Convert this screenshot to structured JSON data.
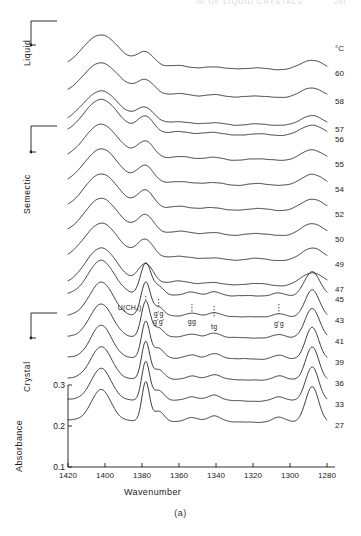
{
  "running_head": {
    "title": "IR OF LIQUID CRYSTALS",
    "page": "241"
  },
  "figure": {
    "caption": "(a)"
  },
  "axes": {
    "x_title": "Wavenumber",
    "y_title": "Absorbance",
    "x_ticks": [
      "1420",
      "1400",
      "1380",
      "1360",
      "1340",
      "1320",
      "1300",
      "1280"
    ],
    "x_tick_values": [
      1420,
      1400,
      1380,
      1360,
      1340,
      1320,
      1300,
      1280
    ],
    "y_ticks": [
      "0.1",
      "0.2",
      "0.3"
    ],
    "y_tick_values": [
      0.1,
      0.2,
      0.3
    ]
  },
  "phases": [
    {
      "name": "liquid",
      "label": "Liquid"
    },
    {
      "name": "smectic",
      "label": "Semectic"
    },
    {
      "name": "crystal",
      "label": "Crystal"
    }
  ],
  "temperature_unit": "°C",
  "temperatures": [
    "60",
    "58",
    "57",
    "56",
    "55",
    "54",
    "52",
    "50",
    "49",
    "47",
    "45",
    "43",
    "41",
    "39",
    "36",
    "33",
    "27"
  ],
  "conformers": [
    {
      "name": "u-ch3",
      "label": "U(CH₃)",
      "wavenumber": 1378
    },
    {
      "name": "g-prime-g",
      "label": "g'g",
      "wavenumber": 1371
    },
    {
      "name": "g-prime-g-prime",
      "label": "g'g'",
      "wavenumber": 1371
    },
    {
      "name": "gg",
      "label": "gg",
      "wavenumber": 1353
    },
    {
      "name": "tg",
      "label": "tg",
      "wavenumber": 1341
    },
    {
      "name": "g-prime-g-2",
      "label": "g'g",
      "wavenumber": 1306
    }
  ],
  "chart_data": {
    "type": "line",
    "title": "",
    "xlabel": "Wavenumber",
    "ylabel": "Absorbance",
    "xlim": [
      1420,
      1280
    ],
    "ylim": [
      0.1,
      0.35
    ],
    "x_reversed": true,
    "grid": false,
    "legend": "right-temperature-labels",
    "series": [
      {
        "name": "60",
        "phase": "liquid",
        "peaks": [
          {
            "x": 1402,
            "rel_height": 1.0,
            "width": 14
          },
          {
            "x": 1378,
            "rel_height": 0.45,
            "width": 7
          },
          {
            "x": 1360,
            "rel_height": 0.12,
            "width": 9
          },
          {
            "x": 1341,
            "rel_height": 0.08,
            "width": 8
          },
          {
            "x": 1318,
            "rel_height": 0.07,
            "width": 9
          },
          {
            "x": 1288,
            "rel_height": 0.3,
            "width": 9
          }
        ]
      },
      {
        "name": "58",
        "phase": "liquid",
        "peaks": [
          {
            "x": 1402,
            "rel_height": 1.0,
            "width": 14
          },
          {
            "x": 1378,
            "rel_height": 0.46,
            "width": 7
          },
          {
            "x": 1360,
            "rel_height": 0.12,
            "width": 9
          },
          {
            "x": 1341,
            "rel_height": 0.08,
            "width": 8
          },
          {
            "x": 1318,
            "rel_height": 0.07,
            "width": 9
          },
          {
            "x": 1288,
            "rel_height": 0.31,
            "width": 9
          }
        ]
      },
      {
        "name": "57",
        "phase": "liquid",
        "peaks": [
          {
            "x": 1402,
            "rel_height": 1.0,
            "width": 14
          },
          {
            "x": 1378,
            "rel_height": 0.47,
            "width": 7
          },
          {
            "x": 1360,
            "rel_height": 0.12,
            "width": 9
          },
          {
            "x": 1341,
            "rel_height": 0.08,
            "width": 8
          },
          {
            "x": 1318,
            "rel_height": 0.07,
            "width": 9
          },
          {
            "x": 1288,
            "rel_height": 0.32,
            "width": 9
          }
        ]
      },
      {
        "name": "56",
        "phase": "smectic",
        "peaks": [
          {
            "x": 1402,
            "rel_height": 1.05,
            "width": 13
          },
          {
            "x": 1378,
            "rel_height": 0.52,
            "width": 6.5
          },
          {
            "x": 1360,
            "rel_height": 0.12,
            "width": 9
          },
          {
            "x": 1341,
            "rel_height": 0.09,
            "width": 8
          },
          {
            "x": 1318,
            "rel_height": 0.07,
            "width": 9
          },
          {
            "x": 1288,
            "rel_height": 0.34,
            "width": 9
          }
        ]
      },
      {
        "name": "55",
        "phase": "smectic",
        "peaks": [
          {
            "x": 1402,
            "rel_height": 1.05,
            "width": 13
          },
          {
            "x": 1378,
            "rel_height": 0.53,
            "width": 6.5
          },
          {
            "x": 1360,
            "rel_height": 0.12,
            "width": 9
          },
          {
            "x": 1341,
            "rel_height": 0.09,
            "width": 8
          },
          {
            "x": 1318,
            "rel_height": 0.07,
            "width": 9
          },
          {
            "x": 1288,
            "rel_height": 0.35,
            "width": 9
          }
        ]
      },
      {
        "name": "54",
        "phase": "smectic",
        "peaks": [
          {
            "x": 1402,
            "rel_height": 1.06,
            "width": 13
          },
          {
            "x": 1378,
            "rel_height": 0.55,
            "width": 6.5
          },
          {
            "x": 1360,
            "rel_height": 0.12,
            "width": 9
          },
          {
            "x": 1341,
            "rel_height": 0.09,
            "width": 8
          },
          {
            "x": 1318,
            "rel_height": 0.07,
            "width": 9
          },
          {
            "x": 1288,
            "rel_height": 0.36,
            "width": 9
          }
        ]
      },
      {
        "name": "52",
        "phase": "smectic",
        "peaks": [
          {
            "x": 1402,
            "rel_height": 1.06,
            "width": 13
          },
          {
            "x": 1378,
            "rel_height": 0.56,
            "width": 6.5
          },
          {
            "x": 1360,
            "rel_height": 0.12,
            "width": 9
          },
          {
            "x": 1341,
            "rel_height": 0.09,
            "width": 8
          },
          {
            "x": 1318,
            "rel_height": 0.07,
            "width": 9
          },
          {
            "x": 1288,
            "rel_height": 0.37,
            "width": 9
          }
        ]
      },
      {
        "name": "50",
        "phase": "smectic",
        "peaks": [
          {
            "x": 1402,
            "rel_height": 1.07,
            "width": 13
          },
          {
            "x": 1378,
            "rel_height": 0.58,
            "width": 6.5
          },
          {
            "x": 1360,
            "rel_height": 0.12,
            "width": 9
          },
          {
            "x": 1341,
            "rel_height": 0.09,
            "width": 8
          },
          {
            "x": 1318,
            "rel_height": 0.07,
            "width": 9
          },
          {
            "x": 1288,
            "rel_height": 0.38,
            "width": 9
          }
        ]
      },
      {
        "name": "49",
        "phase": "smectic",
        "peaks": [
          {
            "x": 1402,
            "rel_height": 1.07,
            "width": 13
          },
          {
            "x": 1378,
            "rel_height": 0.59,
            "width": 6.5
          },
          {
            "x": 1360,
            "rel_height": 0.12,
            "width": 9
          },
          {
            "x": 1341,
            "rel_height": 0.09,
            "width": 8
          },
          {
            "x": 1318,
            "rel_height": 0.07,
            "width": 9
          },
          {
            "x": 1288,
            "rel_height": 0.39,
            "width": 9
          }
        ]
      },
      {
        "name": "47",
        "phase": "smectic",
        "peaks": [
          {
            "x": 1402,
            "rel_height": 1.08,
            "width": 12
          },
          {
            "x": 1378,
            "rel_height": 0.62,
            "width": 6
          },
          {
            "x": 1360,
            "rel_height": 0.12,
            "width": 9
          },
          {
            "x": 1341,
            "rel_height": 0.1,
            "width": 8
          },
          {
            "x": 1318,
            "rel_height": 0.07,
            "width": 9
          },
          {
            "x": 1288,
            "rel_height": 0.4,
            "width": 9
          }
        ]
      },
      {
        "name": "45",
        "phase": "crystal",
        "peaks": [
          {
            "x": 1402,
            "rel_height": 1.0,
            "width": 10
          },
          {
            "x": 1378,
            "rel_height": 0.95,
            "width": 4
          },
          {
            "x": 1371,
            "rel_height": 0.25,
            "width": 4
          },
          {
            "x": 1353,
            "rel_height": 0.1,
            "width": 5
          },
          {
            "x": 1341,
            "rel_height": 0.12,
            "width": 5
          },
          {
            "x": 1306,
            "rel_height": 0.1,
            "width": 5
          },
          {
            "x": 1288,
            "rel_height": 0.72,
            "width": 6
          }
        ]
      },
      {
        "name": "43",
        "phase": "crystal",
        "peaks": [
          {
            "x": 1402,
            "rel_height": 0.98,
            "width": 9
          },
          {
            "x": 1378,
            "rel_height": 1.0,
            "width": 3.6
          },
          {
            "x": 1371,
            "rel_height": 0.26,
            "width": 4
          },
          {
            "x": 1353,
            "rel_height": 0.1,
            "width": 5
          },
          {
            "x": 1341,
            "rel_height": 0.13,
            "width": 5
          },
          {
            "x": 1306,
            "rel_height": 0.11,
            "width": 5
          },
          {
            "x": 1288,
            "rel_height": 0.8,
            "width": 5.5
          }
        ]
      },
      {
        "name": "41",
        "phase": "crystal",
        "peaks": [
          {
            "x": 1402,
            "rel_height": 0.96,
            "width": 8.5
          },
          {
            "x": 1378,
            "rel_height": 1.05,
            "width": 3.4
          },
          {
            "x": 1371,
            "rel_height": 0.27,
            "width": 4
          },
          {
            "x": 1353,
            "rel_height": 0.11,
            "width": 5
          },
          {
            "x": 1341,
            "rel_height": 0.14,
            "width": 5
          },
          {
            "x": 1306,
            "rel_height": 0.12,
            "width": 5
          },
          {
            "x": 1288,
            "rel_height": 0.88,
            "width": 5.5
          }
        ]
      },
      {
        "name": "39",
        "phase": "crystal",
        "peaks": [
          {
            "x": 1402,
            "rel_height": 0.95,
            "width": 8
          },
          {
            "x": 1378,
            "rel_height": 1.08,
            "width": 3.2
          },
          {
            "x": 1371,
            "rel_height": 0.28,
            "width": 4
          },
          {
            "x": 1353,
            "rel_height": 0.11,
            "width": 5
          },
          {
            "x": 1341,
            "rel_height": 0.15,
            "width": 5
          },
          {
            "x": 1306,
            "rel_height": 0.12,
            "width": 5
          },
          {
            "x": 1288,
            "rel_height": 0.94,
            "width": 5
          }
        ]
      },
      {
        "name": "36",
        "phase": "crystal",
        "peaks": [
          {
            "x": 1402,
            "rel_height": 0.94,
            "width": 8
          },
          {
            "x": 1378,
            "rel_height": 1.1,
            "width": 3.1
          },
          {
            "x": 1371,
            "rel_height": 0.28,
            "width": 4
          },
          {
            "x": 1353,
            "rel_height": 0.11,
            "width": 5
          },
          {
            "x": 1341,
            "rel_height": 0.15,
            "width": 5
          },
          {
            "x": 1306,
            "rel_height": 0.13,
            "width": 5
          },
          {
            "x": 1288,
            "rel_height": 0.98,
            "width": 5
          }
        ]
      },
      {
        "name": "33",
        "phase": "crystal",
        "peaks": [
          {
            "x": 1402,
            "rel_height": 0.93,
            "width": 7.5
          },
          {
            "x": 1378,
            "rel_height": 1.12,
            "width": 3.0
          },
          {
            "x": 1371,
            "rel_height": 0.29,
            "width": 4
          },
          {
            "x": 1353,
            "rel_height": 0.12,
            "width": 5
          },
          {
            "x": 1341,
            "rel_height": 0.16,
            "width": 5
          },
          {
            "x": 1306,
            "rel_height": 0.13,
            "width": 5
          },
          {
            "x": 1288,
            "rel_height": 1.02,
            "width": 5
          }
        ]
      },
      {
        "name": "27",
        "phase": "crystal",
        "peaks": [
          {
            "x": 1402,
            "rel_height": 0.92,
            "width": 7.5
          },
          {
            "x": 1378,
            "rel_height": 1.15,
            "width": 2.9
          },
          {
            "x": 1371,
            "rel_height": 0.29,
            "width": 4
          },
          {
            "x": 1353,
            "rel_height": 0.12,
            "width": 5
          },
          {
            "x": 1341,
            "rel_height": 0.16,
            "width": 5
          },
          {
            "x": 1306,
            "rel_height": 0.14,
            "width": 5
          },
          {
            "x": 1288,
            "rel_height": 1.05,
            "width": 5
          }
        ]
      }
    ]
  }
}
